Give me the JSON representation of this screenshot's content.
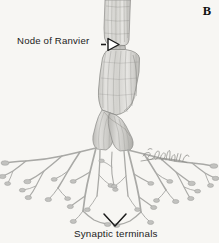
{
  "figure": {
    "panel_letter": "B",
    "background_color": "#f7f6f3",
    "ink_color": "#9a9a98",
    "label_color": "#1b1b1b",
    "myelin_fill_color": "#d6d5d2",
    "myelin_shade_color": "#b3b2ae",
    "terminal_branch_color": "#a8a8a6",
    "artist_signature": "Bodell '97"
  },
  "labels": {
    "node_of_ranvier": "Node of Ranvier",
    "synaptic_terminals": "Synaptic terminals"
  },
  "pointers": {
    "node_of_ranvier_pointer": "arrow-right-hollow-triangle",
    "synaptic_terminals_pointer": "chevron-bracket-down"
  },
  "structures": [
    {
      "name": "myelinated-axon-upper-internode",
      "label": "Myelin sheath internode (upper)"
    },
    {
      "name": "node-of-ranvier-constriction",
      "label": "Node of Ranvier"
    },
    {
      "name": "myelinated-axon-lower-internode",
      "label": "Myelin sheath internode (lower)"
    },
    {
      "name": "axon-bifurcation",
      "label": "Axon branch point"
    },
    {
      "name": "terminal-arborization",
      "label": "Terminal arborization"
    },
    {
      "name": "synaptic-end-bulbs",
      "label": "Synaptic end bulbs"
    }
  ]
}
